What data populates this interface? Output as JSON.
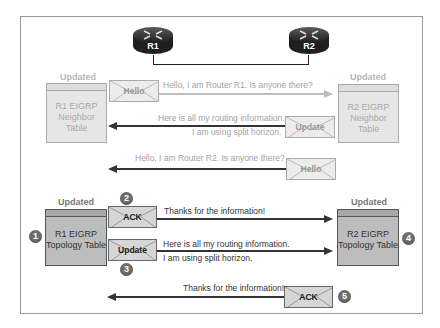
{
  "routers": [
    {
      "label": "R1"
    },
    {
      "label": "R2"
    }
  ],
  "phase1": {
    "r1_table": {
      "status": "Updated",
      "lines": [
        "R1 EIGRP",
        "Neighbor",
        "Table"
      ]
    },
    "r2_table": {
      "status": "Updated",
      "lines": [
        "R2 EIGRP",
        "Neighbor",
        "Table"
      ]
    },
    "hello_r1": {
      "packet": "Hello",
      "message": "Hello, I am Router R1. Is anyone there?"
    },
    "update_r2": {
      "packet": "Update",
      "message_line1": "Here is all my routing information.",
      "message_line2": "I am using split horizon."
    },
    "hello_r2": {
      "packet": "Hello",
      "message": "Hello, I am Router R2. Is anyone there?"
    }
  },
  "phase2": {
    "r1_table": {
      "status": "Updated",
      "lines": [
        "R1 EIGRP",
        "Topology Table"
      ]
    },
    "r2_table": {
      "status": "Updated",
      "lines": [
        "R2 EIGRP",
        "Topology Table"
      ]
    },
    "ack_r1": {
      "packet": "ACK",
      "message": "Thanks for the information!"
    },
    "update_r1": {
      "packet": "Update",
      "message_line1": "Here is all my routing information.",
      "message_line2": "I am using split horizon."
    },
    "ack_r2": {
      "packet": "ACK",
      "message": "Thanks for the information!"
    }
  },
  "steps": [
    "1",
    "2",
    "3",
    "4",
    "5"
  ],
  "colors": {
    "faded_text": "#a3a3a3",
    "dark_text": "#333333",
    "step_badge": "#6e6e6e",
    "router_body": "#2b2b2b"
  }
}
